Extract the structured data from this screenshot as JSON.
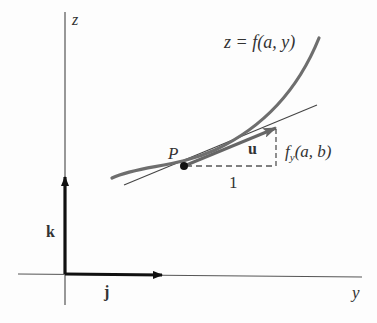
{
  "axes": {
    "z_label": "z",
    "y_label": "y"
  },
  "vectors": {
    "k_label": "k",
    "j_label": "j",
    "u_label": "u"
  },
  "curve": {
    "label": "z = f(a, y)"
  },
  "point": {
    "label": "P"
  },
  "triangle": {
    "run_label": "1",
    "rise_label": "f_y(a, b)",
    "rise_main": "f",
    "rise_sub": "y",
    "rise_args": "(a, b)"
  },
  "colors": {
    "axis": "#555555",
    "curve": "#6e6e6e",
    "vector": "#111111",
    "text": "#333333"
  }
}
